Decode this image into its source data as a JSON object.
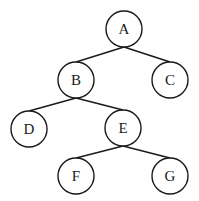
{
  "diagram": {
    "type": "binary-tree",
    "colors": {
      "stroke": "#1a1a1a",
      "fill": "#ffffff",
      "background": "#ffffff"
    },
    "node_radius": 18,
    "nodes": [
      {
        "id": "A",
        "label": "A",
        "x": 124,
        "y": 29
      },
      {
        "id": "B",
        "label": "B",
        "x": 76,
        "y": 80
      },
      {
        "id": "C",
        "label": "C",
        "x": 170,
        "y": 80
      },
      {
        "id": "D",
        "label": "D",
        "x": 29,
        "y": 129
      },
      {
        "id": "E",
        "label": "E",
        "x": 123,
        "y": 128
      },
      {
        "id": "F",
        "label": "F",
        "x": 76,
        "y": 176
      },
      {
        "id": "G",
        "label": "G",
        "x": 170,
        "y": 176
      }
    ],
    "edges": [
      {
        "from": "A",
        "to": "B"
      },
      {
        "from": "A",
        "to": "C"
      },
      {
        "from": "B",
        "to": "D"
      },
      {
        "from": "B",
        "to": "E"
      },
      {
        "from": "E",
        "to": "F"
      },
      {
        "from": "E",
        "to": "G"
      }
    ]
  }
}
